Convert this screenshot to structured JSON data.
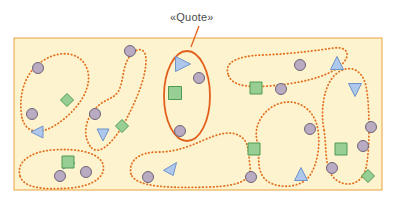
{
  "annotation": {
    "label": "«Quote»",
    "label_x": 170,
    "label_y": 11,
    "leader": {
      "x1": 199,
      "y1": 26,
      "x2": 191,
      "y2": 47
    },
    "highlight_color": "#e2601c",
    "label_color": "#4a4a4a"
  },
  "canvas": {
    "x": 14,
    "y": 38,
    "width": 368,
    "height": 152,
    "fill": "#fdf3cf",
    "border": "#e8a33d"
  },
  "palette": {
    "circle_fill": "#b8abc2",
    "circle_stroke": "#6e6478",
    "square_fill": "#97ce93",
    "square_stroke": "#4e9a4e",
    "diamond_fill": "#97ce93",
    "diamond_stroke": "#4e9a4e",
    "triangle_fill": "#adc8ec",
    "triangle_stroke": "#6f93c7",
    "cluster_dots": "#e2701e",
    "highlight": "#e2601c",
    "page_bg": "#ffffff"
  },
  "clusters": [
    {
      "name": "cluster-upper-left",
      "style": "dotted",
      "path": "M 22 118 C 18 96 24 72 44 60 C 64 48 84 54 88 72 C 92 92 74 112 60 122 C 44 134 27 136 22 118 Z"
    },
    {
      "name": "cluster-left-tail",
      "style": "dotted",
      "path": "M 90 146 C 82 134 86 118 96 108 C 104 99 112 100 118 92 C 124 82 122 66 130 56 C 138 46 146 48 146 60 C 146 78 136 100 128 116 C 118 136 100 160 90 146 Z"
    },
    {
      "name": "cluster-bottom-left",
      "style": "dotted",
      "path": "M 20 176 C 16 162 30 152 52 150 C 76 148 96 152 102 162 C 108 174 96 186 70 188 C 42 190 24 188 20 176 Z"
    },
    {
      "name": "cluster-bottom-center",
      "style": "dotted",
      "path": "M 131 174 C 128 160 140 152 158 152 C 176 152 190 146 204 140 C 218 134 230 130 240 136 C 250 142 248 154 250 166 C 252 180 240 186 210 187 C 172 188 136 188 131 174 Z"
    },
    {
      "name": "cluster-upper-right",
      "style": "dotted",
      "path": "M 228 74 C 224 62 238 56 262 55 C 292 54 320 50 334 48 C 348 46 352 56 340 66 C 326 78 296 84 268 86 C 242 88 231 84 228 74 Z"
    },
    {
      "name": "cluster-mid-right",
      "style": "dotted",
      "path": "M 258 144 C 252 128 262 110 278 104 C 294 98 310 106 316 122 C 322 140 318 166 308 178 C 296 190 272 188 264 178 C 256 168 260 156 258 144 Z"
    },
    {
      "name": "cluster-far-right",
      "style": "dotted",
      "path": "M 324 130 C 320 110 324 84 336 74 C 348 64 362 68 366 86 C 370 106 370 150 366 168 C 362 186 344 188 334 178 C 324 168 327 148 324 130 Z"
    }
  ],
  "highlight_region": {
    "name": "quote-highlight-ellipse",
    "cx": 187,
    "cy": 96,
    "rx": 23,
    "ry": 45
  },
  "shapes": [
    {
      "type": "circle",
      "x": 38,
      "y": 68,
      "size": 11
    },
    {
      "type": "diamond",
      "x": 67,
      "y": 100,
      "size": 13
    },
    {
      "type": "circle",
      "x": 32,
      "y": 114,
      "size": 11
    },
    {
      "type": "triangle",
      "x": 37,
      "y": 132,
      "size": 12,
      "dir": "left"
    },
    {
      "type": "circle",
      "x": 130,
      "y": 51,
      "size": 11
    },
    {
      "type": "circle",
      "x": 95,
      "y": 114,
      "size": 11
    },
    {
      "type": "triangle",
      "x": 103,
      "y": 135,
      "size": 12,
      "dir": "down"
    },
    {
      "type": "diamond",
      "x": 122,
      "y": 126,
      "size": 13
    },
    {
      "type": "triangle",
      "x": 69,
      "y": 163,
      "size": 12,
      "dir": "right"
    },
    {
      "type": "square",
      "x": 68,
      "y": 162,
      "size": 12
    },
    {
      "type": "circle",
      "x": 60,
      "y": 176,
      "size": 11
    },
    {
      "type": "circle",
      "x": 86,
      "y": 172,
      "size": 11
    },
    {
      "type": "triangle",
      "x": 183,
      "y": 64,
      "size": 15,
      "dir": "right"
    },
    {
      "type": "circle",
      "x": 199,
      "y": 78,
      "size": 11
    },
    {
      "type": "square",
      "x": 175,
      "y": 93,
      "size": 13
    },
    {
      "type": "circle",
      "x": 180,
      "y": 131,
      "size": 11
    },
    {
      "type": "circle",
      "x": 148,
      "y": 177,
      "size": 11
    },
    {
      "type": "triangle",
      "x": 170,
      "y": 169,
      "size": 13,
      "dir": "up-right"
    },
    {
      "type": "square",
      "x": 254,
      "y": 149,
      "size": 12
    },
    {
      "type": "circle",
      "x": 251,
      "y": 177,
      "size": 11
    },
    {
      "type": "square",
      "x": 256,
      "y": 88,
      "size": 12
    },
    {
      "type": "circle",
      "x": 281,
      "y": 89,
      "size": 11
    },
    {
      "type": "circle",
      "x": 300,
      "y": 65,
      "size": 11
    },
    {
      "type": "triangle",
      "x": 337,
      "y": 63,
      "size": 13,
      "dir": "up"
    },
    {
      "type": "triangle",
      "x": 355,
      "y": 90,
      "size": 13,
      "dir": "down"
    },
    {
      "type": "circle",
      "x": 310,
      "y": 129,
      "size": 11
    },
    {
      "type": "square",
      "x": 341,
      "y": 149,
      "size": 12
    },
    {
      "type": "circle",
      "x": 332,
      "y": 168,
      "size": 11
    },
    {
      "type": "triangle",
      "x": 301,
      "y": 174,
      "size": 13,
      "dir": "up"
    },
    {
      "type": "circle",
      "x": 371,
      "y": 127,
      "size": 11
    },
    {
      "type": "circle",
      "x": 363,
      "y": 146,
      "size": 11
    },
    {
      "type": "diamond",
      "x": 368,
      "y": 176,
      "size": 13
    }
  ]
}
